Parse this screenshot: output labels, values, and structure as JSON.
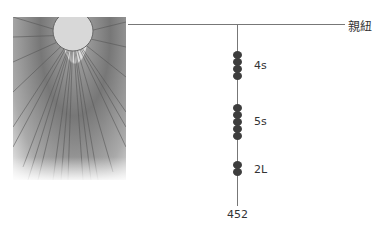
{
  "title_label": "親紐",
  "root_label": "452",
  "groups": [
    {
      "label": "4s",
      "count": 4
    },
    {
      "label": "5s",
      "count": 5
    },
    {
      "label": "2L",
      "count": 2
    }
  ],
  "photo": {
    "description": "khipu-photo"
  }
}
